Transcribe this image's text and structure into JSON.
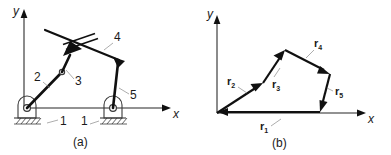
{
  "figure": {
    "title_a": "(a)",
    "title_b": "(b)"
  },
  "panel_a": {
    "caption": "(a)",
    "axis_x_label": "x",
    "axis_y_label": "y",
    "link_labels": [
      {
        "id": "link-1-left",
        "text": "1"
      },
      {
        "id": "link-1-right",
        "text": "1"
      },
      {
        "id": "link-2",
        "text": "2"
      },
      {
        "id": "link-3",
        "text": "3"
      },
      {
        "id": "link-4",
        "text": "4"
      },
      {
        "id": "link-5",
        "text": "5"
      }
    ]
  },
  "panel_b": {
    "caption": "(b)",
    "axis_x_label": "x",
    "axis_y_label": "y",
    "vectors": [
      {
        "id": "r1",
        "base": "r",
        "sub": "1"
      },
      {
        "id": "r2",
        "base": "r",
        "sub": "2"
      },
      {
        "id": "r3",
        "base": "r",
        "sub": "3"
      },
      {
        "id": "r4",
        "base": "r",
        "sub": "4"
      },
      {
        "id": "r5",
        "base": "r",
        "sub": "5"
      }
    ]
  },
  "colors": {
    "ink": "#101010",
    "axis": "#6e6e6e",
    "leader": "#8a8a8a",
    "ground": "#3a3a3a",
    "background": "#ffffff"
  }
}
